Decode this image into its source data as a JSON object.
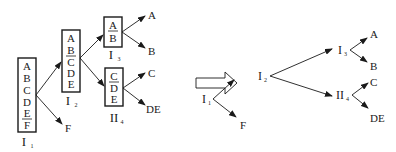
{
  "diagram": {
    "left_tree": {
      "boxes": [
        {
          "id": "I1",
          "label_main": "I",
          "label_sub": "1",
          "items": [
            "A",
            "B",
            "C",
            "D",
            "E",
            "F"
          ],
          "split_after": "E"
        },
        {
          "id": "I2",
          "label_main": "I",
          "label_sub": "2",
          "items": [
            "A",
            "B",
            "C",
            "D",
            "E"
          ],
          "split_after": "B"
        },
        {
          "id": "I3",
          "label_main": "I",
          "label_sub": "3",
          "items": [
            "A",
            "B"
          ],
          "split_after": "A"
        },
        {
          "id": "II4",
          "label_main": "II",
          "label_sub": "4",
          "items": [
            "C",
            "D",
            "E"
          ],
          "split_after": "C"
        }
      ],
      "leaves": {
        "A": "A",
        "B": "B",
        "C": "C",
        "DE": "DE",
        "F": "F"
      }
    },
    "transform_arrow": "hollow-right-arrow",
    "right_tree": {
      "nodes": [
        {
          "id": "I1",
          "main": "I",
          "sub": "1"
        },
        {
          "id": "I2",
          "main": "I",
          "sub": "2"
        },
        {
          "id": "I3",
          "main": "I",
          "sub": "3"
        },
        {
          "id": "II4",
          "main": "II",
          "sub": "4"
        }
      ],
      "leaves": {
        "A": "A",
        "B": "B",
        "C": "C",
        "DE": "DE",
        "F": "F"
      }
    }
  }
}
